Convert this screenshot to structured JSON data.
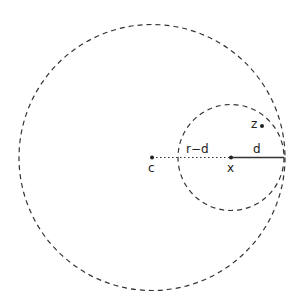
{
  "diagram": {
    "labels": {
      "c": "c",
      "x": "x",
      "z": "z",
      "d": "d",
      "r_minus_d": "r−d"
    },
    "colors": {
      "stroke": "#333333",
      "background": "#ffffff"
    }
  }
}
